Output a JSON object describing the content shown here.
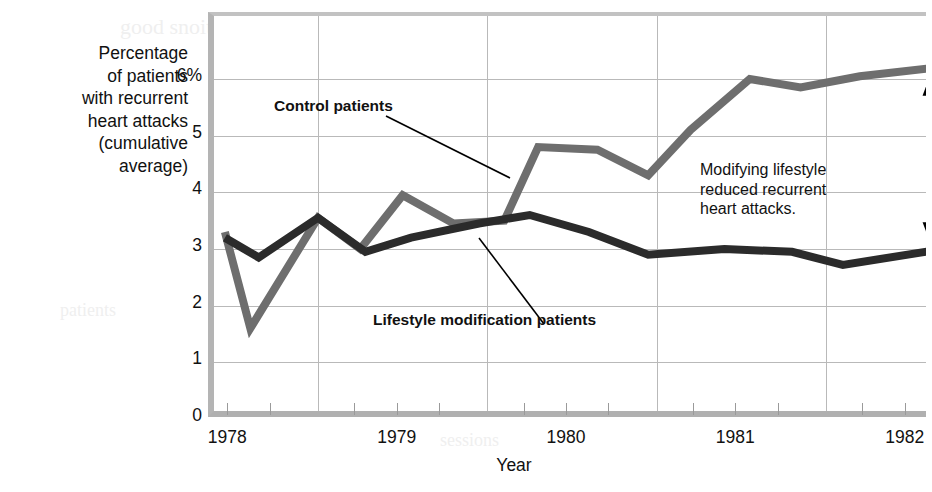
{
  "chart_data": {
    "type": "line",
    "title": "",
    "xlabel": "Year",
    "ylabel": "Percentage of patients with recurrent heart attacks (cumulative average)",
    "ylabel_lines": [
      "Percentage",
      "of patients",
      "with recurrent",
      "heart attacks",
      "(cumulative",
      "average)"
    ],
    "ylim": [
      0,
      6.6
    ],
    "yticks": [
      0,
      1,
      2,
      3,
      4,
      5,
      6
    ],
    "ytick_labels": [
      "0",
      "1",
      "2",
      "3",
      "4",
      "5",
      "6%"
    ],
    "xlim": [
      1977.75,
      1982.3
    ],
    "xticks": [
      1978,
      1979,
      1980,
      1981,
      1982
    ],
    "xtick_labels": [
      "1978",
      "1979",
      "1980",
      "1981",
      "1982"
    ],
    "gridlines_vertical_at": [
      1978.5,
      1979.5,
      1980.5,
      1981.5
    ],
    "grid": true,
    "legend": "inline-callouts",
    "series": [
      {
        "name": "Control patients",
        "color": "#6e6e6e",
        "x": [
          1977.95,
          1978.1,
          1978.5,
          1978.75,
          1979.0,
          1979.3,
          1979.6,
          1979.8,
          1980.15,
          1980.45,
          1980.7,
          1981.05,
          1981.35,
          1981.7,
          1982.15
        ],
        "y": [
          3.3,
          1.6,
          3.55,
          3.0,
          3.95,
          3.45,
          3.5,
          4.8,
          4.75,
          4.3,
          5.1,
          6.0,
          5.85,
          6.05,
          6.2
        ]
      },
      {
        "name": "Lifestyle modification patients",
        "color": "#2b2b2b",
        "x": [
          1977.95,
          1978.15,
          1978.5,
          1978.78,
          1979.05,
          1979.45,
          1979.75,
          1980.1,
          1980.45,
          1980.9,
          1981.3,
          1981.6,
          1982.15
        ],
        "y": [
          3.2,
          2.85,
          3.55,
          2.95,
          3.2,
          3.45,
          3.6,
          3.3,
          2.9,
          3.0,
          2.95,
          2.72,
          2.98
        ]
      }
    ],
    "annotations": [
      {
        "id": "control",
        "text": "Control patients",
        "bold": true
      },
      {
        "id": "lifestyle",
        "text": "Lifestyle modification patients",
        "bold": true
      },
      {
        "id": "reduced",
        "text": "Modifying lifestyle reduced recurrent heart attacks.",
        "bold": false,
        "lines": [
          "Modifying lifestyle",
          "reduced recurrent",
          "heart attacks."
        ]
      }
    ],
    "arrow": {
      "name": "difference-arrow",
      "orientation": "vertical",
      "double_headed": true,
      "from_value": 6.2,
      "to_value": 2.98,
      "at_x": 1982.15
    },
    "colors": {
      "control_line": "#6e6e6e",
      "lifestyle_line": "#2b2b2b",
      "grid": "#b9b9b9",
      "frame": "#b4b4b4",
      "text": "#111111",
      "background": "#ffffff"
    }
  },
  "ghost_text": {
    "items": [
      {
        "text": "good snoitacifidom yeht",
        "x": 120,
        "y": 14,
        "size": 22
      },
      {
        "text": "low fat diet",
        "x": 300,
        "y": 96,
        "size": 20
      },
      {
        "text": "exercise",
        "x": 640,
        "y": 126,
        "size": 17
      },
      {
        "text": "behavior",
        "x": 616,
        "y": 248,
        "size": 16
      },
      {
        "text": "modification",
        "x": 606,
        "y": 268,
        "size": 16
      },
      {
        "text": "stress",
        "x": 700,
        "y": 330,
        "size": 16
      },
      {
        "text": "reduction",
        "x": 260,
        "y": 200,
        "size": 20
      },
      {
        "text": "patients",
        "x": 60,
        "y": 300,
        "size": 18
      },
      {
        "text": "sessions",
        "x": 440,
        "y": 430,
        "size": 18
      }
    ]
  }
}
